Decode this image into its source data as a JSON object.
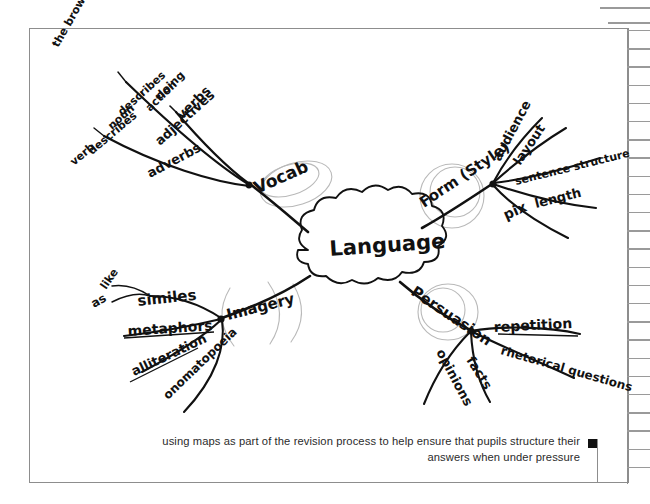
{
  "document": {
    "type": "scanned-page",
    "page_background": "#ffffff",
    "frame_color": "#8d8d8d",
    "ink_color": "#111111",
    "pencil_color": "#b9b9b9"
  },
  "mindmap": {
    "center": {
      "label": "Language",
      "shape": "cloud"
    },
    "branches": [
      {
        "id": "vocab",
        "label": "Vocab",
        "position": "upper-left",
        "children": [
          {
            "label": "verbs",
            "notes": [
              "doing",
              "action"
            ]
          },
          {
            "label": "adjectives",
            "notes": [
              "describes",
              "noun",
              "the brown dog"
            ]
          },
          {
            "label": "adverbs",
            "notes": [
              "describes",
              "verb"
            ]
          }
        ]
      },
      {
        "id": "form-style",
        "label": "Form (Style)",
        "position": "upper-right",
        "children": [
          {
            "label": "audience",
            "notes": []
          },
          {
            "label": "layout",
            "notes": []
          },
          {
            "label": "sentence structure",
            "notes": []
          },
          {
            "label": "length",
            "notes": []
          },
          {
            "label": "pix",
            "notes": []
          }
        ]
      },
      {
        "id": "imagery",
        "label": "Imagery",
        "position": "lower-left",
        "children": [
          {
            "label": "similes",
            "notes": [
              "like",
              "as"
            ]
          },
          {
            "label": "metaphors",
            "notes": []
          },
          {
            "label": "alliteration",
            "notes": []
          },
          {
            "label": "onomatopoeia",
            "notes": []
          }
        ]
      },
      {
        "id": "persuasion",
        "label": "Persuasion",
        "position": "lower-right",
        "children": [
          {
            "label": "repetition",
            "notes": []
          },
          {
            "label": "rhetorical questions",
            "notes": []
          },
          {
            "label": "facts",
            "notes": []
          },
          {
            "label": "opinions",
            "notes": []
          }
        ]
      }
    ]
  },
  "caption": {
    "line1": "using maps as part of the revision process to help ensure that pupils structure their",
    "line2": "answers when under pressure",
    "end_marker": "■"
  }
}
